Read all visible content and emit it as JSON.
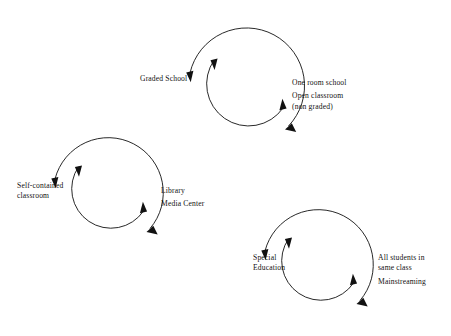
{
  "page": {
    "background_color": "#ffffff",
    "ink_color": "#111111",
    "width": 451,
    "height": 336
  },
  "diagram": {
    "type": "cycle-diagram",
    "units": [
      {
        "id": "graded-school-cycle",
        "center": {
          "x": 245,
          "y": 85
        },
        "outer_radius": 58,
        "inner_radius": 40,
        "left_label": {
          "lines": [
            "Graded School"
          ]
        },
        "right_label": {
          "groups": [
            {
              "lines": [
                "One room school"
              ]
            },
            {
              "lines": [
                "Open classroom",
                "(non graded)"
              ]
            }
          ]
        }
      },
      {
        "id": "self-contained-classroom-cycle",
        "center": {
          "x": 108,
          "y": 190
        },
        "outer_radius": 55,
        "inner_radius": 38,
        "left_label": {
          "lines": [
            "Self-contained",
            "classroom"
          ]
        },
        "right_label": {
          "groups": [
            {
              "lines": [
                "Library"
              ]
            },
            {
              "lines": [
                "Media Center"
              ]
            }
          ]
        }
      },
      {
        "id": "special-education-cycle",
        "center": {
          "x": 318,
          "y": 262
        },
        "outer_radius": 55,
        "inner_radius": 38,
        "left_label": {
          "lines": [
            "Special",
            "Education"
          ]
        },
        "right_label": {
          "groups": [
            {
              "lines": [
                "All students in",
                "same class"
              ]
            },
            {
              "lines": [
                "Mainstreaming"
              ]
            }
          ]
        }
      }
    ]
  },
  "labels": {
    "graded_school": "Graded School",
    "one_room_school": "One room school",
    "open_classroom": "Open classroom",
    "non_graded": "(non graded)",
    "self_contained": "Self-contained",
    "classroom": "classroom",
    "library": "Library",
    "media_center": "Media Center",
    "special": "Special",
    "education": "Education",
    "all_students_in": "All students in",
    "same_class": "same class",
    "mainstreaming": "Mainstreaming"
  }
}
